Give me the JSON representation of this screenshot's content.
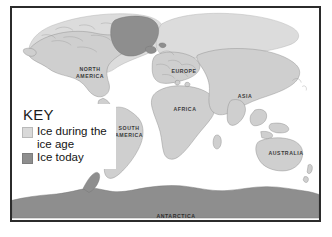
{
  "map": {
    "title": "World map of ice coverage during the ice age and today",
    "key": {
      "title": "KEY",
      "entries": [
        {
          "swatch": "light-gray-swatch",
          "color": "#d9d9d9",
          "label": "Ice during the ice age"
        },
        {
          "swatch": "dark-gray-swatch",
          "color": "#8e8e8e",
          "label": "Ice today"
        }
      ]
    },
    "labels": {
      "north_america": "NORTH\nAMERICA",
      "south_america": "SOUTH\nAMERICA",
      "europe": "EUROPE",
      "africa": "AFRICA",
      "asia": "ASIA",
      "australia": "AUSTRALIA",
      "antarctica": "ANTARCTICA"
    },
    "colors": {
      "land": "#cfcfcf",
      "ocean": "#ffffff",
      "ice_age": "#dcdcdc",
      "ice_today": "#8e8e8e",
      "coastline": "#8a8a8a",
      "frame": "#2b2b2b",
      "label_text": "#3a3a3a"
    }
  }
}
